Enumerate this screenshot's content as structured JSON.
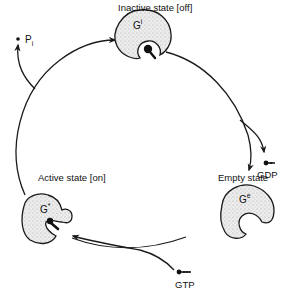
{
  "diagram": {
    "states": [
      {
        "id": "inactive",
        "label": "Inactive state [off]",
        "protein": "G",
        "superscript": "i"
      },
      {
        "id": "empty",
        "label": "Empty state",
        "protein": "G",
        "superscript": "e"
      },
      {
        "id": "active",
        "label": "Active state [on]",
        "protein": "G",
        "superscript": "*"
      }
    ],
    "molecules": {
      "released_phosphate": "P",
      "released_phosphate_sub": "i",
      "released_nucleotide": "GDP",
      "bound_nucleotide": "GTP"
    },
    "colors": {
      "line": "#1a1a1a",
      "protein_fill": "#e4e4e4",
      "background": "#ffffff"
    }
  }
}
